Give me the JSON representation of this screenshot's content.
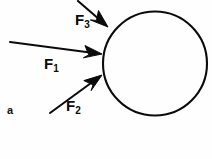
{
  "figure": {
    "panel_label": "a",
    "background_color": "#fefefe",
    "stroke_color": "#0b0b0b",
    "body": {
      "shape_name": "circle",
      "center_x": 155,
      "center_y": 63.5,
      "radius": 52,
      "stroke_width": 2.1
    },
    "forces": [
      {
        "label": "F",
        "subscript": "1",
        "tail_x": 10,
        "tail_y": 42,
        "tip_x": 102,
        "tip_y": 54,
        "direction": "right"
      },
      {
        "label": "F",
        "subscript": "2",
        "tail_x": 50,
        "tail_y": 113,
        "tip_x": 102,
        "tip_y": 75,
        "direction": "up-right"
      },
      {
        "label": "F",
        "subscript": "3",
        "tail_x": 78,
        "tail_y": 1,
        "tip_x": 108,
        "tip_y": 27,
        "direction": "down-right"
      }
    ]
  }
}
